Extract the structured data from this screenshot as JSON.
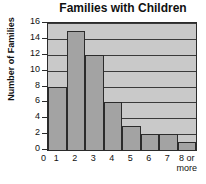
{
  "chart_data": {
    "type": "bar",
    "title": "Families with Children",
    "xlabel": "",
    "ylabel": "Number of Families",
    "categories": [
      "1",
      "2",
      "3",
      "4",
      "5",
      "6",
      "7",
      "8 or more"
    ],
    "values": [
      8,
      15,
      12,
      6,
      3,
      2,
      2,
      1
    ],
    "ylim": [
      0,
      16
    ],
    "yticks": [
      0,
      2,
      4,
      6,
      8,
      10,
      12,
      14,
      16
    ],
    "ytick_labels": [
      "0",
      "2",
      "4",
      "6",
      "8",
      "10",
      "12",
      "14",
      "16"
    ],
    "grid": true,
    "legend": null,
    "colors": {
      "bar_fill": "#a3a3a3",
      "bar_edge": "#2b2b2b",
      "plot_background": "#c9c9c9",
      "gridline": "#3a3a3a",
      "text": "#111111",
      "figure_background": "#ffffff"
    },
    "origin_label": "0",
    "category_lines": [
      [
        "1"
      ],
      [
        "2"
      ],
      [
        "3"
      ],
      [
        "4"
      ],
      [
        "5"
      ],
      [
        "6"
      ],
      [
        "7"
      ],
      [
        "8 or",
        "more"
      ]
    ]
  }
}
